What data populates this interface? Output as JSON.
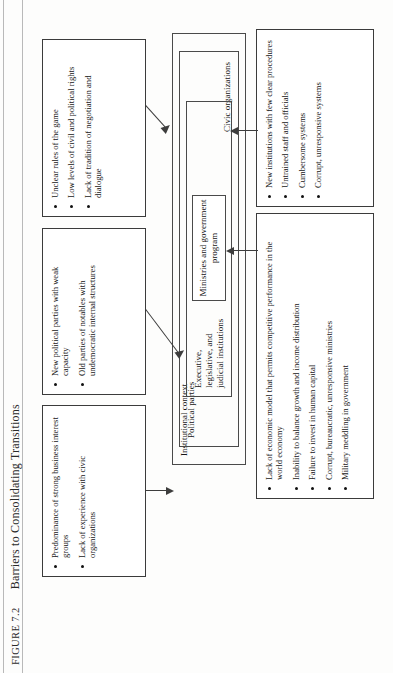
{
  "caption": {
    "figure_label": "Figure 7.2",
    "title": "Barriers to Consolidating Transitions"
  },
  "nested": {
    "outer_label": "Institutional context",
    "second_label": "Political parties",
    "third_label": "Executive, legislative, and judicial institutions",
    "core_label": "Ministries and government program",
    "bottom_label": "Civic organizations"
  },
  "top_boxes": [
    {
      "id": "rules-box",
      "bullets": [
        "Unclear rules of the game",
        "Low levels of civil and political rights",
        "Lack of tradition of negotiation and dialogue"
      ]
    },
    {
      "id": "parties-box",
      "bullets": [
        "New political parties with weak capacity",
        "Old parties of notables with undemocratic internal structures"
      ]
    },
    {
      "id": "civic-box",
      "bullets": [
        "Predominance of strong business interest groups",
        "Lack of experience with civic organizations"
      ]
    }
  ],
  "bottom_boxes": [
    {
      "id": "institutions-box",
      "bullets": [
        "New institutions with few clear procedures",
        "Untrained staff and officials",
        "Cumbersome systems",
        "Corrupt, unresponsive systems"
      ]
    },
    {
      "id": "economy-box",
      "bullets": [
        "Lack of economic model that permits competitive performance in the world economy",
        "Inability to balance growth and income distribution",
        "Failure to invest in human capital",
        "Corrupt, bureaucratic, unresponsive ministries",
        "Military meddling in government"
      ]
    }
  ],
  "colors": {
    "ink": "#1a1a1a",
    "rule": "#3b3b3b",
    "paper": "#fdfdfc"
  }
}
